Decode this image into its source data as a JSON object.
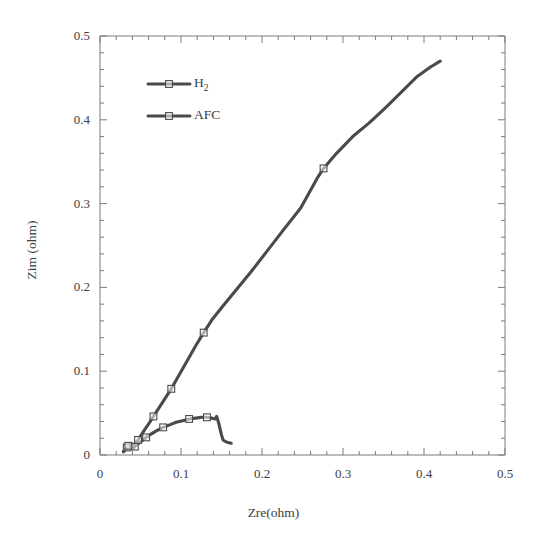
{
  "chart_data": {
    "type": "line",
    "title": "",
    "xlabel": "Zre(ohm)",
    "ylabel": "Zim (ohm)",
    "xlim": [
      0,
      0.5
    ],
    "ylim": [
      0,
      0.5
    ],
    "xticks": [
      "0",
      "0.1",
      "0.2",
      "0.3",
      "0.4",
      "0.5"
    ],
    "xtick_values": [
      0,
      0.1,
      0.2,
      0.3,
      0.4,
      0.5
    ],
    "yticks": [
      "0",
      "0.1",
      "0.2",
      "0.3",
      "0.4",
      "0.5"
    ],
    "ytick_values": [
      0,
      0.1,
      0.2,
      0.3,
      0.4,
      0.5
    ],
    "grid": false,
    "minor_ticks_per_major": 5,
    "legend_position": "upper-left-inside",
    "series_color": "#4a4a4a",
    "axis_color": "#7a7a7a",
    "text_color": "#3d3d3d",
    "series": [
      {
        "name": "H2",
        "legend_label_main": "H",
        "legend_label_sub": "2",
        "marker": "open-square",
        "points": [
          [
            0.029,
            0.004
          ],
          [
            0.031,
            0.006
          ],
          [
            0.033,
            0.009
          ],
          [
            0.035,
            0.01
          ],
          [
            0.037,
            0.011
          ],
          [
            0.039,
            0.009
          ],
          [
            0.041,
            0.008
          ],
          [
            0.043,
            0.01
          ],
          [
            0.045,
            0.012
          ],
          [
            0.048,
            0.014
          ],
          [
            0.052,
            0.017
          ],
          [
            0.057,
            0.021
          ],
          [
            0.063,
            0.025
          ],
          [
            0.07,
            0.029
          ],
          [
            0.078,
            0.033
          ],
          [
            0.086,
            0.036
          ],
          [
            0.094,
            0.039
          ],
          [
            0.102,
            0.041
          ],
          [
            0.11,
            0.043
          ],
          [
            0.118,
            0.044
          ],
          [
            0.126,
            0.045
          ],
          [
            0.132,
            0.045
          ],
          [
            0.138,
            0.044
          ],
          [
            0.142,
            0.043
          ],
          [
            0.144,
            0.046
          ],
          [
            0.146,
            0.04
          ],
          [
            0.148,
            0.032
          ],
          [
            0.15,
            0.024
          ],
          [
            0.152,
            0.018
          ],
          [
            0.155,
            0.016
          ],
          [
            0.158,
            0.015
          ],
          [
            0.162,
            0.014
          ]
        ],
        "markers_at": [
          [
            0.033,
            0.009
          ],
          [
            0.043,
            0.01
          ],
          [
            0.057,
            0.021
          ],
          [
            0.078,
            0.033
          ],
          [
            0.11,
            0.043
          ],
          [
            0.132,
            0.045
          ]
        ]
      },
      {
        "name": "AFC",
        "legend_label_main": "AFC",
        "legend_label_sub": "",
        "marker": "open-square",
        "points": [
          [
            0.029,
            0.004
          ],
          [
            0.032,
            0.007
          ],
          [
            0.035,
            0.011
          ],
          [
            0.038,
            0.013
          ],
          [
            0.041,
            0.012
          ],
          [
            0.044,
            0.014
          ],
          [
            0.047,
            0.018
          ],
          [
            0.051,
            0.024
          ],
          [
            0.055,
            0.03
          ],
          [
            0.06,
            0.037
          ],
          [
            0.066,
            0.046
          ],
          [
            0.072,
            0.055
          ],
          [
            0.08,
            0.067
          ],
          [
            0.088,
            0.079
          ],
          [
            0.098,
            0.096
          ],
          [
            0.108,
            0.113
          ],
          [
            0.118,
            0.13
          ],
          [
            0.128,
            0.146
          ],
          [
            0.138,
            0.161
          ],
          [
            0.152,
            0.178
          ],
          [
            0.168,
            0.197
          ],
          [
            0.186,
            0.218
          ],
          [
            0.206,
            0.243
          ],
          [
            0.226,
            0.268
          ],
          [
            0.248,
            0.295
          ],
          [
            0.268,
            0.33
          ],
          [
            0.276,
            0.342
          ],
          [
            0.292,
            0.36
          ],
          [
            0.312,
            0.38
          ],
          [
            0.332,
            0.396
          ],
          [
            0.352,
            0.414
          ],
          [
            0.372,
            0.433
          ],
          [
            0.392,
            0.452
          ],
          [
            0.408,
            0.463
          ],
          [
            0.42,
            0.47
          ]
        ],
        "markers_at": [
          [
            0.035,
            0.011
          ],
          [
            0.047,
            0.018
          ],
          [
            0.066,
            0.046
          ],
          [
            0.088,
            0.079
          ],
          [
            0.128,
            0.146
          ],
          [
            0.276,
            0.342
          ]
        ]
      }
    ]
  },
  "legend": {
    "entries": [
      {
        "label_main": "H",
        "label_sub": "2"
      },
      {
        "label_main": "AFC",
        "label_sub": ""
      }
    ]
  }
}
